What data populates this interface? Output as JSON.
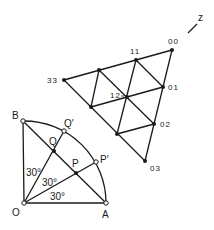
{
  "diagram": {
    "axis": {
      "label": "z"
    },
    "lattice": {
      "labels": {
        "p00": "00",
        "p11": "11",
        "p33": "33",
        "p12": "12",
        "p01": "01",
        "p02": "02",
        "p03": "03"
      }
    },
    "sector": {
      "labels": {
        "O": "O",
        "A": "A",
        "B": "B",
        "P": "P",
        "Q": "Q",
        "Pprime": "P′",
        "Qprime": "Q′"
      },
      "angles": [
        "30°",
        "30°",
        "30°"
      ]
    }
  }
}
